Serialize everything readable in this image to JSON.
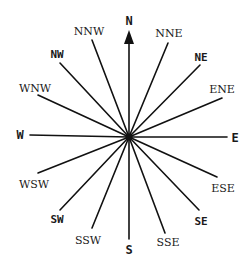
{
  "diagram": {
    "type": "compass-rose",
    "center": {
      "x": 129,
      "y": 137
    },
    "arrow_direction": "N",
    "points": [
      {
        "label": "N",
        "weight": "cardinal",
        "line_end": [
          129,
          30
        ],
        "label_pos": [
          129,
          21
        ]
      },
      {
        "label": "NNE",
        "weight": "minor",
        "line_end": [
          168,
          43
        ],
        "label_pos": [
          169,
          33
        ]
      },
      {
        "label": "NE",
        "weight": "major",
        "line_end": [
          200,
          65
        ],
        "label_pos": [
          201,
          57
        ]
      },
      {
        "label": "ENE",
        "weight": "minor",
        "line_end": [
          222,
          98
        ],
        "label_pos": [
          222,
          89
        ]
      },
      {
        "label": "E",
        "weight": "cardinal",
        "line_end": [
          227,
          137
        ],
        "label_pos": [
          235,
          138
        ]
      },
      {
        "label": "ESE",
        "weight": "minor",
        "line_end": [
          217,
          177
        ],
        "label_pos": [
          223,
          188
        ]
      },
      {
        "label": "SE",
        "weight": "major",
        "line_end": [
          199,
          210
        ],
        "label_pos": [
          201,
          221
        ]
      },
      {
        "label": "SSE",
        "weight": "minor",
        "line_end": [
          165,
          233
        ],
        "label_pos": [
          168,
          242
        ]
      },
      {
        "label": "S",
        "weight": "cardinal",
        "line_end": [
          129,
          239
        ],
        "label_pos": [
          129,
          250
        ]
      },
      {
        "label": "SSW",
        "weight": "minor",
        "line_end": [
          92,
          228
        ],
        "label_pos": [
          88,
          240
        ]
      },
      {
        "label": "SW",
        "weight": "major",
        "line_end": [
          60,
          210
        ],
        "label_pos": [
          57,
          219
        ]
      },
      {
        "label": "WSW",
        "weight": "minor",
        "line_end": [
          38,
          173
        ],
        "label_pos": [
          34,
          184
        ]
      },
      {
        "label": "W",
        "weight": "cardinal",
        "line_end": [
          30,
          135
        ],
        "label_pos": [
          20,
          135
        ]
      },
      {
        "label": "WNW",
        "weight": "minor",
        "line_end": [
          38,
          95
        ],
        "label_pos": [
          35,
          88
        ]
      },
      {
        "label": "NW",
        "weight": "major",
        "line_end": [
          60,
          63
        ],
        "label_pos": [
          57,
          54
        ]
      },
      {
        "label": "NNW",
        "weight": "minor",
        "line_end": [
          92,
          40
        ],
        "label_pos": [
          89,
          31
        ]
      }
    ],
    "colors": {
      "line": "#111111",
      "text": "#1a1a1a",
      "background": "#ffffff"
    }
  }
}
